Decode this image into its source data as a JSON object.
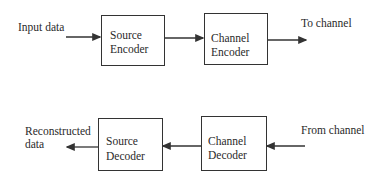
{
  "diagram": {
    "type": "block-diagram",
    "encoder_chain": {
      "input_label": "Input data",
      "blocks": [
        {
          "line1": "Source",
          "line2": "Encoder"
        },
        {
          "line1": "Channel",
          "line2": "Encoder"
        }
      ],
      "output_label": "To channel"
    },
    "decoder_chain": {
      "input_label": "From channel",
      "blocks": [
        {
          "line1": "Channel",
          "line2": "Decoder"
        },
        {
          "line1": "Source",
          "line2": "Decoder"
        }
      ],
      "output_label_line1": "Reconstructed",
      "output_label_line2": "data"
    },
    "colors": {
      "line": "#333333",
      "text": "#2a2a2a",
      "background": "#ffffff"
    }
  }
}
